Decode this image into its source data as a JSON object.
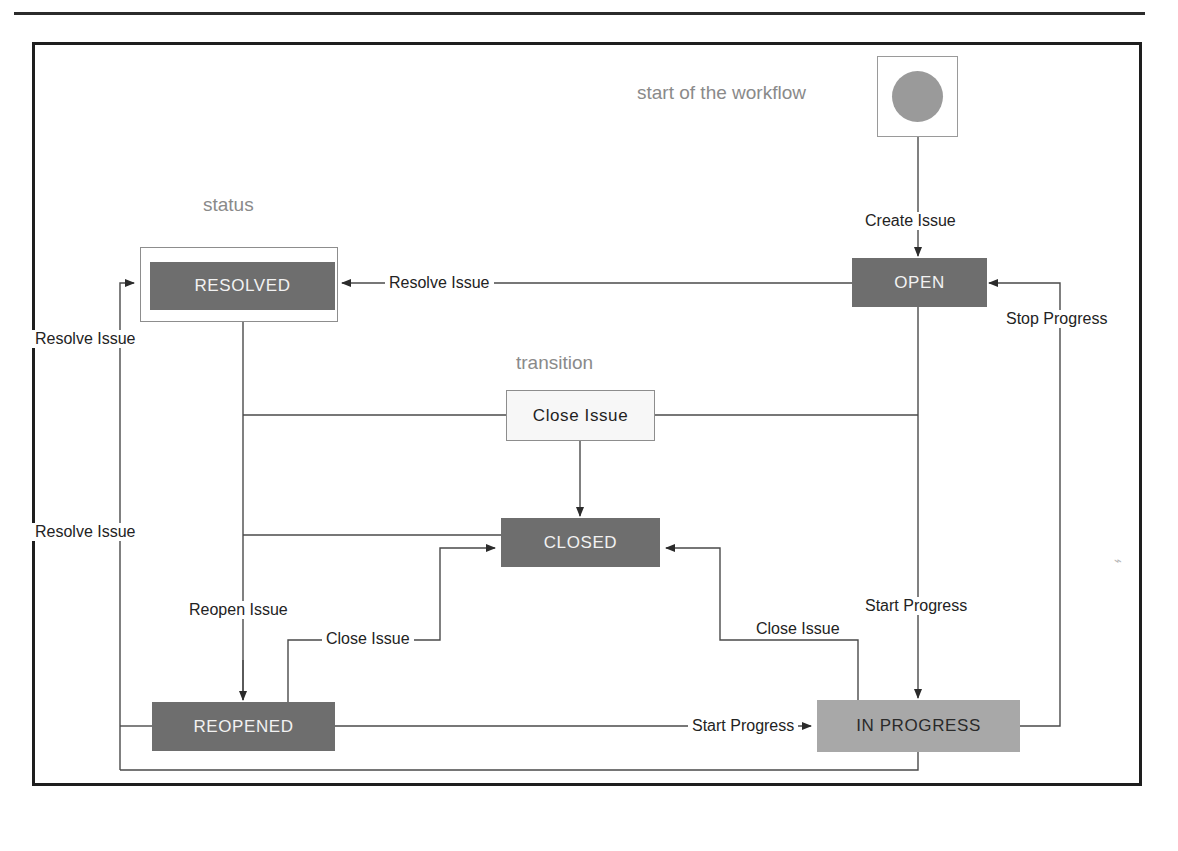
{
  "diagram": {
    "frame": {
      "present": true
    },
    "captions": [
      {
        "id": "start-caption",
        "text": "start of the workflow"
      },
      {
        "id": "status-caption",
        "text": "status"
      },
      {
        "id": "transition-caption",
        "text": "transition"
      }
    ],
    "start_node": {
      "label": "",
      "shape": "filled-circle",
      "color": "#9a9a9a"
    },
    "statuses": [
      {
        "id": "open",
        "label": "OPEN",
        "fill": "#6e6e6e",
        "text_color": "#f2f2f2",
        "selected": false
      },
      {
        "id": "resolved",
        "label": "RESOLVED",
        "fill": "#6e6e6e",
        "text_color": "#f2f2f2",
        "selected": true
      },
      {
        "id": "closed",
        "label": "CLOSED",
        "fill": "#6e6e6e",
        "text_color": "#f2f2f2",
        "selected": false
      },
      {
        "id": "reopened",
        "label": "REOPENED",
        "fill": "#6e6e6e",
        "text_color": "#f2f2f2",
        "selected": false
      },
      {
        "id": "in_progress",
        "label": "IN PROGRESS",
        "fill": "#a8a8a8",
        "text_color": "#2a2a2a",
        "selected": false
      }
    ],
    "transitions": [
      {
        "id": "close-issue-box",
        "label": "Close Issue",
        "rendered_as": "box"
      }
    ],
    "edge_labels": [
      {
        "id": "create-issue",
        "text": "Create Issue",
        "from": "start",
        "to": "open"
      },
      {
        "id": "resolve-issue-top",
        "text": "Resolve Issue",
        "from": "open",
        "to": "resolved"
      },
      {
        "id": "stop-progress",
        "text": "Stop Progress",
        "from": "in_progress",
        "to": "open"
      },
      {
        "id": "resolve-issue-mid",
        "text": "Resolve Issue",
        "from": "reopened",
        "to": "resolved"
      },
      {
        "id": "resolve-issue-low",
        "text": "Resolve Issue",
        "from": "in_progress",
        "to": "resolved"
      },
      {
        "id": "reopen-issue",
        "text": "Reopen Issue",
        "from": "resolved",
        "to": "reopened"
      },
      {
        "id": "close-issue-reopened",
        "text": "Close Issue",
        "from": "reopened",
        "to": "closed"
      },
      {
        "id": "close-issue-inprogress",
        "text": "Close Issue",
        "from": "in_progress",
        "to": "closed"
      },
      {
        "id": "start-progress-open",
        "text": "Start Progress",
        "from": "open",
        "to": "in_progress"
      },
      {
        "id": "start-progress-reopened",
        "text": "Start Progress",
        "from": "reopened",
        "to": "in_progress"
      }
    ],
    "colors": {
      "status_fill": "#6e6e6e",
      "status_fill_light": "#a8a8a8",
      "frame_border": "#1e1e1e",
      "wire": "#3a3a3a",
      "caption_text": "#8a8a8a"
    }
  }
}
